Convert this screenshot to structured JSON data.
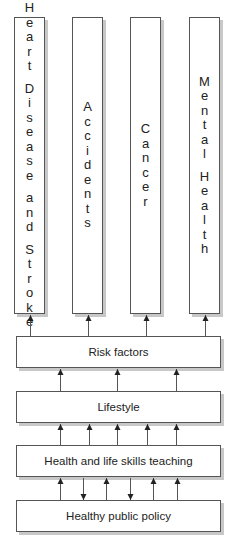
{
  "diagram": {
    "columns": [
      {
        "label": "Heart Disease and Stroke",
        "words": [
          "Heart",
          "Disease",
          "and",
          "Stroke"
        ]
      },
      {
        "label": "Accidents",
        "words": [
          "Accidents"
        ]
      },
      {
        "label": "Cancer",
        "words": [
          "Cancer"
        ]
      },
      {
        "label": "Mental Health",
        "words": [
          "Mental",
          "Health"
        ]
      }
    ],
    "layers": {
      "risk_factors": "Risk factors",
      "lifestyle": "Lifestyle",
      "teaching": "Health and life skills teaching",
      "policy": "Healthy public policy"
    },
    "arrows": {
      "risk_to_columns": {
        "direction": "up",
        "x": [
          30,
          88,
          146,
          205
        ]
      },
      "lifestyle_to_risk": {
        "direction": "up",
        "x": [
          60,
          117,
          176
        ]
      },
      "teaching_to_lifestyle": {
        "direction": "up",
        "x": [
          60,
          89,
          117,
          147,
          176
        ]
      },
      "policy_teaching": [
        {
          "x": 60,
          "direction": "up"
        },
        {
          "x": 83,
          "direction": "down"
        },
        {
          "x": 106,
          "direction": "up"
        },
        {
          "x": 130,
          "direction": "down"
        },
        {
          "x": 153,
          "direction": "up"
        },
        {
          "x": 177,
          "direction": "up"
        }
      ]
    },
    "colors": {
      "stroke": "#555555",
      "shadow": "#c8c8c8",
      "text": "#222222"
    }
  }
}
